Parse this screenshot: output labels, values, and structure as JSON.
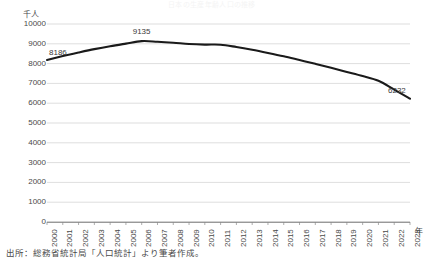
{
  "chart_data": {
    "type": "line",
    "title": "日本の生産年齢人口の推移",
    "xlabel": "年",
    "ylabel": "千人",
    "ylim": [
      0,
      10000
    ],
    "ytick_step": 1000,
    "yticks": [
      0,
      1000,
      2000,
      3000,
      4000,
      5000,
      6000,
      7000,
      8000,
      9000,
      10000
    ],
    "grid": true,
    "legend": "none",
    "categories": [
      "2000",
      "2001",
      "2002",
      "2003",
      "2004",
      "2005",
      "2006",
      "2007",
      "2008",
      "2009",
      "2010",
      "2011",
      "2012",
      "2013",
      "2014",
      "2015",
      "2016",
      "2017",
      "2018",
      "2019",
      "2020",
      "2021",
      "2022",
      "2023"
    ],
    "series": [
      {
        "name": "人口",
        "values": [
          8186,
          8380,
          8560,
          8730,
          8880,
          9010,
          9135,
          9105,
          9055,
          8990,
          8960,
          8955,
          8840,
          8700,
          8540,
          8370,
          8180,
          7990,
          7790,
          7580,
          7370,
          7130,
          6690,
          6232
        ]
      }
    ],
    "annotations": [
      {
        "label": "8186",
        "year": "2000",
        "value": 8186
      },
      {
        "label": "9135",
        "year": "2006",
        "value": 9135
      },
      {
        "label": "6232",
        "year": "2023",
        "value": 6232
      }
    ],
    "line_color": "#1a1a1a",
    "grid_color": "#c8c8c8",
    "axis_color": "#808080"
  },
  "source": {
    "note": "出所：総務省統計局「人口統計」より筆者作成。"
  }
}
